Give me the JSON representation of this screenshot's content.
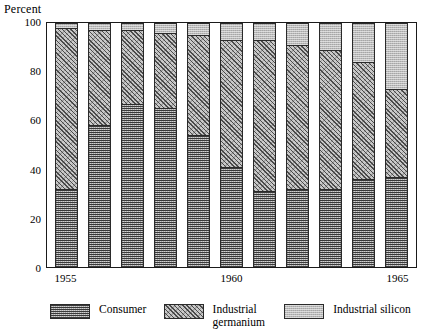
{
  "axis_title": "Percent",
  "y_ticks": [
    100,
    80,
    60,
    40,
    20,
    0
  ],
  "x_tick_labels": [
    "1955",
    "1960",
    "1965"
  ],
  "legend": {
    "items": [
      {
        "label": "Consumer",
        "key": "consumer",
        "color": "#6f6f6f"
      },
      {
        "label": "Industrial\ngermanium",
        "key": "germanium",
        "color": "#c9c9c9"
      },
      {
        "label": "Industrial silicon",
        "key": "silicon",
        "color": "#b9b9b9"
      }
    ]
  },
  "chart_data": {
    "type": "bar",
    "stacked": true,
    "title": "",
    "xlabel": "",
    "ylabel": "Percent",
    "ylim": [
      0,
      100
    ],
    "grid": false,
    "legend_position": "bottom",
    "categories": [
      "1955",
      "1956",
      "1957",
      "1958",
      "1959",
      "1960",
      "1961",
      "1962",
      "1963",
      "1964",
      "1965"
    ],
    "tick_categories": [
      "1955",
      "1960",
      "1965"
    ],
    "series": [
      {
        "name": "Consumer",
        "values": [
          32,
          58,
          67,
          65,
          54,
          41,
          31,
          32,
          32,
          36,
          37
        ]
      },
      {
        "name": "Industrial germanium",
        "values": [
          66,
          39,
          30,
          31,
          41,
          52,
          62,
          59,
          57,
          48,
          36
        ]
      },
      {
        "name": "Industrial silicon",
        "values": [
          2,
          3,
          3,
          4,
          5,
          7,
          7,
          9,
          11,
          16,
          27
        ]
      }
    ],
    "cumulative_tops": {
      "consumer": [
        32,
        58,
        67,
        65,
        54,
        41,
        31,
        32,
        32,
        36,
        37
      ],
      "germanium": [
        98,
        97,
        97,
        96,
        95,
        93,
        93,
        91,
        89,
        84,
        73
      ],
      "silicon": [
        100,
        100,
        100,
        100,
        100,
        100,
        100,
        100,
        100,
        100,
        100
      ]
    }
  }
}
